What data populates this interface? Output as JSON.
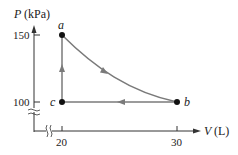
{
  "diagram": {
    "type": "PV diagram",
    "y_axis": {
      "label_var": "P",
      "label_unit": "(kPa)",
      "ticks": [
        {
          "value": "150"
        },
        {
          "value": "100"
        }
      ]
    },
    "x_axis": {
      "label_var": "V",
      "label_unit": "(L)",
      "ticks": [
        {
          "value": "20"
        },
        {
          "value": "30"
        }
      ]
    },
    "points": [
      {
        "name": "a",
        "V": 20,
        "P": 150
      },
      {
        "name": "b",
        "V": 30,
        "P": 100
      },
      {
        "name": "c",
        "V": 20,
        "P": 100
      }
    ],
    "paths": [
      {
        "from": "a",
        "to": "b",
        "shape": "curve"
      },
      {
        "from": "b",
        "to": "c",
        "shape": "line"
      },
      {
        "from": "c",
        "to": "a",
        "shape": "line"
      }
    ],
    "colors": {
      "axis": "#333333",
      "process": "#7a7a7a",
      "point": "#111111"
    }
  }
}
